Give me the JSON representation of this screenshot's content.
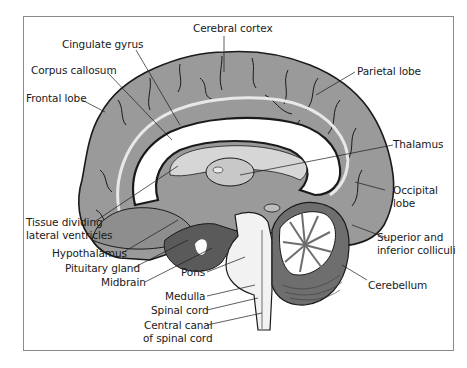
{
  "diagram": {
    "type": "anatomical-illustration",
    "colors": {
      "cortex": "#9a9a9a",
      "cortex_outline": "#1a1a1a",
      "white_matter": "#ffffff",
      "corpus_callosum": "#d6d6d6",
      "dark_region": "#5a5a5a",
      "brainstem": "#f2f2f2",
      "cerebellum": "#6e6e6e",
      "frame": "#8a8a8a"
    },
    "labels": {
      "cerebral_cortex": "Cerebral cortex",
      "cingulate_gyrus": "Cingulate gyrus",
      "corpus_callosum": "Corpus callosum",
      "frontal_lobe": "Frontal lobe",
      "parietal_lobe": "Parietal lobe",
      "thalamus": "Thalamus",
      "occipital_lobe_1": "Occipital",
      "occipital_lobe_2": "lobe",
      "tissue_dividing_1": "Tissue dividing",
      "tissue_dividing_2": "lateral ventricles",
      "superior_colliculi_1": "Superior and",
      "superior_colliculi_2": "inferior colliculi",
      "hypothalamus": "Hypothalamus",
      "pituitary_gland": "Pituitary gland",
      "midbrain": "Midbrain",
      "pons": "Pons",
      "cerebellum": "Cerebellum",
      "medulla": "Medulla",
      "spinal_cord": "Spinal cord",
      "central_canal_1": "Central canal",
      "central_canal_2": "of spinal cord"
    }
  }
}
